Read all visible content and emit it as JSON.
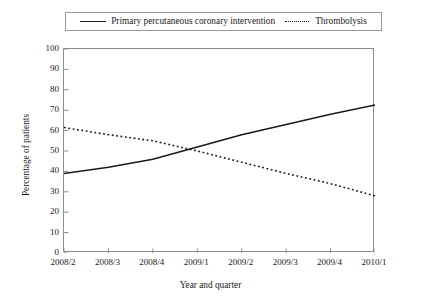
{
  "chart_data": {
    "type": "line",
    "title": "",
    "xlabel": "Year and quarter",
    "ylabel": "Percentage of patients",
    "categories": [
      "2008/2",
      "2008/3",
      "2008/4",
      "2009/1",
      "2009/2",
      "2009/3",
      "2009/4",
      "2010/1"
    ],
    "ylim": [
      0,
      100
    ],
    "yticks": [
      0,
      10,
      20,
      30,
      40,
      50,
      60,
      70,
      80,
      90,
      100
    ],
    "ytick_labels": [
      "0",
      "10",
      "20",
      "30",
      "40",
      "50",
      "60",
      "70",
      "80",
      "90",
      "100"
    ],
    "grid": false,
    "legend_position": "top-center",
    "series": [
      {
        "name": "Primary percutaneous coronary intervention",
        "style": "solid",
        "color": "#1a1a1a",
        "values": [
          39,
          42,
          46,
          52,
          58,
          63,
          68,
          72.5
        ]
      },
      {
        "name": "Thrombolysis",
        "style": "dotted",
        "color": "#1a1a1a",
        "values": [
          61.5,
          58,
          55,
          50,
          44.5,
          39,
          34,
          28
        ]
      }
    ],
    "annotations": []
  },
  "legend": {
    "entries": [
      {
        "label": "Primary percutaneous coronary intervention",
        "swatch": "solid-line-swatch"
      },
      {
        "label": "Thrombolysis",
        "swatch": "dotted-line-swatch"
      }
    ]
  }
}
